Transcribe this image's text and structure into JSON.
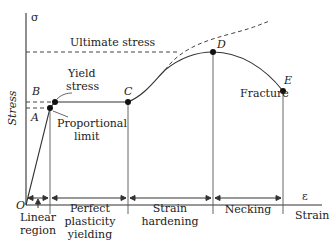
{
  "diagram": {
    "axes": {
      "y_symbol": "σ",
      "y_label": "Stress",
      "x_symbol": "ε",
      "x_label": "Strain",
      "origin_label": "O"
    },
    "reference_lines": {
      "ultimate_stress": "Ultimate stress"
    },
    "points": [
      {
        "id": "A",
        "label": "A",
        "annotation": "Proportional limit",
        "annotation_line1": "Proportional",
        "annotation_line2": "limit"
      },
      {
        "id": "B",
        "label": "B",
        "annotation": "Yield stress",
        "annotation_line1": "Yield",
        "annotation_line2": "stress"
      },
      {
        "id": "C",
        "label": "C"
      },
      {
        "id": "D",
        "label": "D"
      },
      {
        "id": "E",
        "label": "E",
        "annotation": "Fracture"
      }
    ],
    "regions": [
      {
        "id": "linear",
        "line1": "Linear",
        "line2": "region"
      },
      {
        "id": "perfect_plasticity",
        "line1": "Perfect",
        "line2": "plasticity",
        "line3": "yielding"
      },
      {
        "id": "strain_hardening",
        "line1": "Strain",
        "line2": "hardening"
      },
      {
        "id": "necking",
        "line1": "Necking"
      }
    ],
    "colors": {
      "line": "#333333",
      "point": "#111111",
      "background": "#ffffff"
    }
  }
}
